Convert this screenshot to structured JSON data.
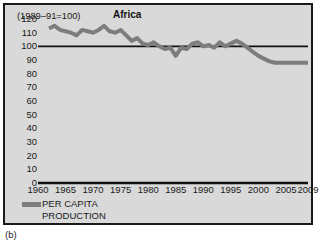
{
  "figure": {
    "caption": "(b)",
    "background_color": "#d9d9d9",
    "border_color": "#1a1a1a"
  },
  "legend": {
    "position": "below-axis-left",
    "swatch_color": "#7d7d7d",
    "label": "PER CAPITA\nPRODUCTION"
  },
  "chart_data": {
    "type": "line",
    "title": "Africa",
    "subtitle": "(1989–91=100)",
    "xlabel": "",
    "ylabel": "",
    "xlim": [
      1960,
      2009
    ],
    "ylim": [
      0,
      120
    ],
    "grid": false,
    "legend_position": "bottom-left",
    "x_tick_labels": [
      "1960",
      "1965",
      "1970",
      "1975",
      "1980",
      "1985",
      "1990",
      "1995",
      "2000",
      "2005",
      "2009"
    ],
    "x_ticks": [
      1960,
      1965,
      1970,
      1975,
      1980,
      1985,
      1990,
      1995,
      2000,
      2005,
      2009
    ],
    "y_tick_labels": [
      "120",
      "110",
      "100",
      "90",
      "80",
      "70",
      "60",
      "50",
      "40",
      "30",
      "20",
      "10",
      "0"
    ],
    "y_ticks": [
      120,
      110,
      100,
      90,
      80,
      70,
      60,
      50,
      40,
      30,
      20,
      10,
      0
    ],
    "reference_line": {
      "value": 100,
      "color": "#111111",
      "x_start": 1960,
      "x_end": 2009
    },
    "baseline": {
      "value": 0,
      "color": "#111111"
    },
    "series": [
      {
        "name": "PER CAPITA PRODUCTION",
        "color": "#7d7d7d",
        "line_width": 4,
        "x": [
          1962,
          1963,
          1964,
          1965,
          1966,
          1967,
          1968,
          1969,
          1970,
          1971,
          1972,
          1973,
          1974,
          1975,
          1976,
          1977,
          1978,
          1979,
          1980,
          1981,
          1982,
          1983,
          1984,
          1985,
          1986,
          1987,
          1988,
          1989,
          1990,
          1991,
          1992,
          1993,
          1994,
          1995,
          1996,
          1997,
          1998,
          1999,
          2000,
          2001,
          2002,
          2003,
          2004,
          2005,
          2006,
          2007,
          2008,
          2009
        ],
        "values": [
          113,
          115,
          112,
          111,
          110,
          108,
          112,
          111,
          110,
          112,
          115,
          111,
          110,
          112,
          108,
          104,
          106,
          102,
          101,
          103,
          100,
          98,
          99,
          93,
          99,
          98,
          102,
          103,
          100,
          101,
          99,
          103,
          100,
          102,
          104,
          102,
          99,
          96,
          93,
          91,
          89,
          88,
          88,
          88,
          88,
          88,
          88,
          88
        ]
      }
    ]
  }
}
